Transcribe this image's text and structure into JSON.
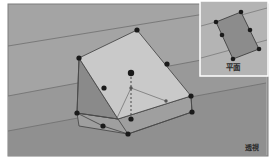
{
  "figure": {
    "canvas": {
      "width": 274,
      "height": 164
    },
    "colors": {
      "page_background": "#ffffff",
      "scene_background": "#9b9b9b",
      "scene_background_upper": "#a4a4a4",
      "scene_border": "#7d7d7d",
      "ground_plane": "#949494",
      "top_face": "#c9c9c9",
      "side_face_dark": "#8a8a8a",
      "base_face": "#9f9f9f",
      "inset_background": "#b4b4b4",
      "inset_quad_fill": "#8c8c8c",
      "inset_border": "#ffffff",
      "line_stroke": "#4a4a4a",
      "guide_stroke": "#6f6f6f",
      "vertex_fill": "#1a1a1a",
      "vertex_small_fill": "#555555",
      "label_text": "#2b2b2b"
    }
  },
  "perspective_view": {
    "label": "透視",
    "label_position": {
      "x": 252,
      "y": 150
    },
    "ground_lines": [
      {
        "name": "horizon-line-upper",
        "x1": 8,
        "y1": 46,
        "x2": 266,
        "y2": 4
      },
      {
        "name": "horizon-line-lower",
        "x1": 8,
        "y1": 131,
        "x2": 266,
        "y2": 83
      },
      {
        "name": "receding-line-left",
        "x1": 8,
        "y1": 96,
        "x2": 266,
        "y2": 48
      }
    ],
    "top_face": {
      "name": "top-quad-face",
      "points": "79,58 137,30 191,96 118,119"
    },
    "side_face": {
      "name": "left-side-face",
      "points": "79,58 118,119 77,113"
    },
    "base_face": {
      "name": "base-quad-face",
      "points": "77,113 118,119 191,96 192,112 128,134 79,126"
    },
    "edges": [
      {
        "name": "edge-top-left",
        "x1": 79,
        "y1": 58,
        "x2": 137,
        "y2": 30
      },
      {
        "name": "edge-top-right",
        "x1": 137,
        "y1": 30,
        "x2": 191,
        "y2": 96
      },
      {
        "name": "edge-bottom-right",
        "x1": 191,
        "y1": 96,
        "x2": 118,
        "y2": 119
      },
      {
        "name": "edge-bottom-left",
        "x1": 118,
        "y1": 119,
        "x2": 79,
        "y2": 58
      },
      {
        "name": "edge-vertical-left",
        "x1": 79,
        "y1": 58,
        "x2": 77,
        "y2": 113
      },
      {
        "name": "edge-base-bottom-left",
        "x1": 77,
        "y1": 113,
        "x2": 103,
        "y2": 126
      },
      {
        "name": "edge-base-bottom-mid",
        "x1": 103,
        "y1": 126,
        "x2": 128,
        "y2": 134
      },
      {
        "name": "edge-base-bottom-right",
        "x1": 128,
        "y1": 134,
        "x2": 192,
        "y2": 112
      },
      {
        "name": "edge-base-right-up",
        "x1": 192,
        "y1": 112,
        "x2": 191,
        "y2": 96
      },
      {
        "name": "edge-base-inner",
        "x1": 77,
        "y1": 113,
        "x2": 118,
        "y2": 119
      },
      {
        "name": "edge-base-inner-right",
        "x1": 118,
        "y1": 119,
        "x2": 128,
        "y2": 134
      }
    ],
    "center_axis": {
      "name": "center-dashed-axis",
      "x1": 131,
      "y1": 73,
      "x2": 131,
      "y2": 119,
      "dash": "2,2"
    },
    "leader_lines": [
      {
        "name": "leader-left",
        "x1": 131,
        "y1": 88,
        "x2": 117,
        "y2": 118
      },
      {
        "name": "leader-right",
        "x1": 131,
        "y1": 88,
        "x2": 166,
        "y2": 101
      }
    ],
    "vertices": [
      {
        "name": "vertex-top-apex",
        "cx": 137,
        "cy": 30,
        "r": 2.6
      },
      {
        "name": "vertex-left-upper",
        "cx": 79,
        "cy": 58,
        "r": 2.6
      },
      {
        "name": "vertex-left-mid",
        "cx": 104,
        "cy": 88,
        "r": 2.6
      },
      {
        "name": "vertex-right-upper",
        "cx": 167,
        "cy": 64,
        "r": 2.6
      },
      {
        "name": "vertex-right-lower",
        "cx": 191,
        "cy": 96,
        "r": 2.6
      },
      {
        "name": "vertex-center-top",
        "cx": 131,
        "cy": 73,
        "r": 3.2
      },
      {
        "name": "vertex-center-bottom",
        "cx": 131,
        "cy": 119,
        "r": 2.6
      },
      {
        "name": "vertex-base-left",
        "cx": 77,
        "cy": 113,
        "r": 2.6
      },
      {
        "name": "vertex-base-mid-left",
        "cx": 103,
        "cy": 126,
        "r": 2.6
      },
      {
        "name": "vertex-base-bottom",
        "cx": 128,
        "cy": 134,
        "r": 2.6
      },
      {
        "name": "vertex-base-right",
        "cx": 192,
        "cy": 112,
        "r": 2.6
      }
    ],
    "small_markers": [
      {
        "name": "marker-center-node",
        "cx": 131,
        "cy": 88,
        "r": 1.7
      },
      {
        "name": "marker-leader-right-end",
        "cx": 166,
        "cy": 101,
        "r": 1.7
      }
    ]
  },
  "plan_view_inset": {
    "label": "平面",
    "label_position": {
      "x": 233,
      "y": 70
    },
    "panel": {
      "x": 200,
      "y": 1,
      "width": 68,
      "height": 75
    },
    "guide_lines": [
      {
        "name": "inset-guide-upper",
        "x1": 201,
        "y1": 26,
        "x2": 267,
        "y2": 8
      },
      {
        "name": "inset-guide-lower",
        "x1": 201,
        "y1": 58,
        "x2": 267,
        "y2": 40
      }
    ],
    "quad": {
      "name": "inset-plan-quad",
      "points": "216,22 241,12 259,49 233,59"
    },
    "vertices": [
      {
        "name": "inset-vertex-top-left",
        "cx": 216,
        "cy": 22,
        "r": 2.3
      },
      {
        "name": "inset-vertex-top-right",
        "cx": 241,
        "cy": 12,
        "r": 2.3
      },
      {
        "name": "inset-vertex-mid-left",
        "cx": 222,
        "cy": 35,
        "r": 2.3
      },
      {
        "name": "inset-vertex-mid-right",
        "cx": 250,
        "cy": 30,
        "r": 2.3
      },
      {
        "name": "inset-vertex-bottom-left",
        "cx": 233,
        "cy": 59,
        "r": 2.3
      },
      {
        "name": "inset-vertex-bottom-right",
        "cx": 259,
        "cy": 49,
        "r": 2.3
      }
    ]
  }
}
